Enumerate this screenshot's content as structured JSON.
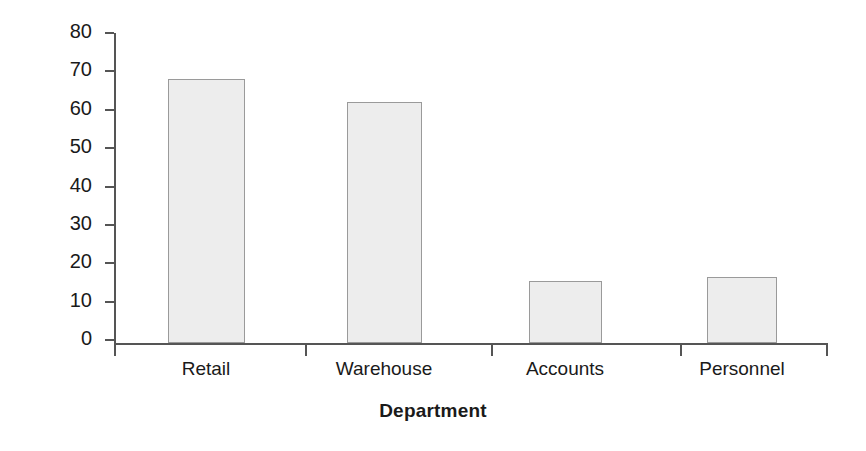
{
  "chart_data": {
    "type": "bar",
    "title": "",
    "subtitle": "",
    "categories": [
      "Retail",
      "Warehouse",
      "Accounts",
      "Personnel"
    ],
    "values": [
      68,
      62,
      16,
      17
    ],
    "xlabel": "Department",
    "ylabel": "Frequency",
    "ylim": [
      0,
      80
    ],
    "ytick_values": [
      0,
      10,
      20,
      30,
      40,
      50,
      60,
      70,
      80
    ],
    "ytick_labels": [
      "0",
      "10",
      "20",
      "30",
      "40",
      "50",
      "60",
      "70",
      "80"
    ],
    "grid": false,
    "legend": false,
    "legend_position": "none",
    "bar_fill_color": "#ededed",
    "bar_border_color": "#9a9a9a",
    "axis_color": "#555555",
    "background_color": "#ffffff",
    "text_color": "#1a1a1a"
  }
}
